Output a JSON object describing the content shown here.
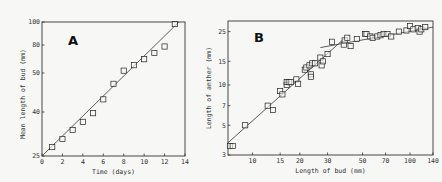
{
  "chart_data": [
    {
      "type": "scatter",
      "panel": "A",
      "title": "A",
      "xlabel": "Time (days)",
      "ylabel": "Mean length of bud (mm)",
      "x_ticks": [
        0,
        2,
        4,
        6,
        8,
        10,
        12,
        14
      ],
      "y_ticks": [
        25,
        40,
        50,
        80,
        100
      ],
      "xlim": [
        0,
        14
      ],
      "ylim": [
        25,
        100
      ],
      "y_scale": "log",
      "grid": false,
      "fit_line": {
        "x": [
          0,
          13.4
        ],
        "y": [
          25,
          100
        ]
      },
      "series": [
        {
          "name": "bud length",
          "marker": "square",
          "x": [
            1,
            2,
            3,
            4,
            5,
            6,
            7,
            8,
            9,
            10,
            11,
            12,
            13
          ],
          "y": [
            27.5,
            30,
            33,
            36,
            39.5,
            43,
            47,
            52,
            57,
            63,
            70,
            78,
            98
          ]
        }
      ]
    },
    {
      "type": "scatter",
      "panel": "B",
      "title": "B",
      "xlabel": "Length of bud (mm)",
      "ylabel": "Length of anther (mm)",
      "x_ticks": [
        10,
        15,
        20,
        30,
        50,
        70,
        100,
        140
      ],
      "y_ticks": [
        3,
        5,
        7,
        10,
        15,
        25
      ],
      "xlim": [
        7,
        140
      ],
      "ylim": [
        3,
        30
      ],
      "x_scale": "log",
      "y_scale": "log",
      "grid": false,
      "fit_lines": [
        {
          "name": "steep segment",
          "x": [
            7,
            38
          ],
          "y": [
            3.7,
            22
          ]
        },
        {
          "name": "shallow segment",
          "x": [
            27,
            140
          ],
          "y": [
            19,
            27
          ]
        }
      ],
      "series": [
        {
          "name": "anther vs bud",
          "marker": "square",
          "x": [
            7.2,
            7.5,
            9,
            12.5,
            13.5,
            15,
            15.5,
            16.5,
            16.5,
            17,
            17.5,
            19,
            19.5,
            21.5,
            22,
            23,
            23.5,
            23.5,
            24,
            25,
            27,
            27.5,
            28,
            30,
            32,
            38,
            38.5,
            40,
            42,
            46,
            52,
            53,
            56,
            58,
            62,
            65,
            68,
            72,
            76,
            85,
            95,
            100,
            105,
            112,
            115,
            118,
            125
          ],
          "y": [
            3.5,
            3.5,
            5,
            7,
            6.5,
            9,
            8.5,
            10,
            10.5,
            10.5,
            10.5,
            11,
            10.2,
            13,
            13.5,
            14,
            12,
            11.5,
            14.5,
            14.5,
            16,
            14,
            15,
            17,
            21,
            20,
            21.5,
            22.5,
            19.5,
            22,
            24,
            24,
            23,
            22.5,
            23,
            23.5,
            24,
            24,
            23,
            25,
            25.5,
            27.5,
            26,
            26.5,
            25,
            26,
            27
          ]
        }
      ]
    }
  ]
}
